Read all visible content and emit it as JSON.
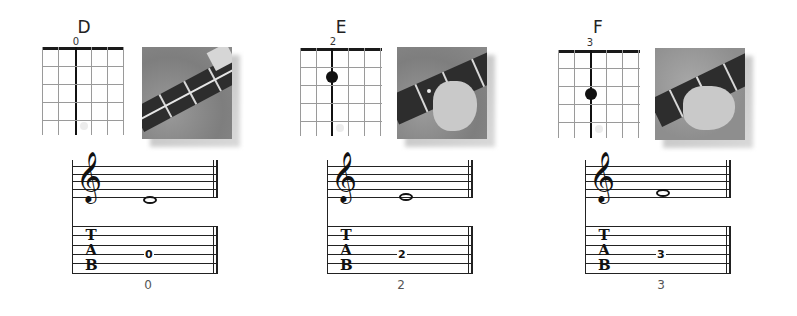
{
  "lessons": [
    {
      "chord": "D",
      "fret_label": "0",
      "fret": 0,
      "tab_value": "0",
      "caption": "0",
      "photo_alt": "guitar-neck-photo-open"
    },
    {
      "chord": "E",
      "fret_label": "2",
      "fret": 2,
      "tab_value": "2",
      "caption": "2",
      "photo_alt": "guitar-neck-photo-fret-2"
    },
    {
      "chord": "F",
      "fret_label": "3",
      "fret": 3,
      "tab_value": "3",
      "caption": "3",
      "photo_alt": "guitar-neck-photo-fret-3"
    }
  ],
  "tab_clef": {
    "t": "T",
    "a": "A",
    "b": "B"
  },
  "treble_clef_glyph": "𝄞",
  "colors": {
    "ink": "#111111",
    "grid": "#9a9a9a",
    "caption": "#555555"
  }
}
